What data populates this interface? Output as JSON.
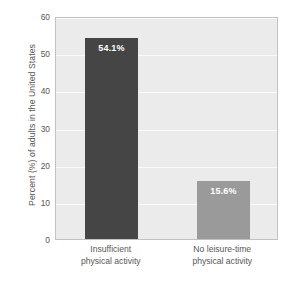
{
  "chart_data": {
    "type": "bar",
    "title": "",
    "subtitle": "",
    "xlabel": "",
    "ylabel": "Percent (%) of adults in the United States",
    "ylim": [
      0,
      60
    ],
    "yticks": [
      0,
      10,
      20,
      30,
      40,
      50,
      60
    ],
    "ytick_labels": [
      "0",
      "10",
      "20",
      "30",
      "40",
      "50",
      "60"
    ],
    "grid": true,
    "legend": "none",
    "categories": [
      "Insufficient physical activity",
      "No leisure-time physical activity"
    ],
    "category_lines": [
      [
        "Insufficient",
        "physical activity"
      ],
      [
        "No leisure-time",
        "physical activity"
      ]
    ],
    "values": [
      54.1,
      15.6
    ],
    "value_labels": [
      "54.1%",
      "15.6%"
    ],
    "bar_colors": [
      "#454545",
      "#9a9a9a"
    ],
    "value_label_color": "#ffffff",
    "plot_background": "#ebebeb",
    "gridline_color": "#fafafa",
    "page_background": "#ffffff",
    "axis_text_color": "#575757"
  }
}
